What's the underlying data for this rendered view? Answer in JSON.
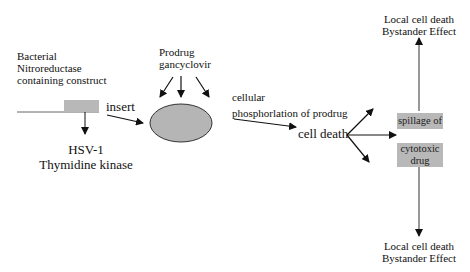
{
  "diagram": {
    "construct": {
      "label_lines": [
        "Bacterial",
        "Nitroreductase",
        "containing construct"
      ],
      "insert_label": "insert",
      "gene_label_lines": [
        "HSV-1",
        "Thymidine kinase"
      ]
    },
    "prodrug": {
      "label_lines": [
        "Prodrug",
        "gancyclovir"
      ]
    },
    "phosphorylation": {
      "label_lines": [
        "cellular",
        "phosphorlation of prodrug"
      ]
    },
    "cell_death": {
      "label": "cell death"
    },
    "spillage": {
      "label": "spillage of"
    },
    "cytotoxic": {
      "label_lines": [
        "cytotoxic",
        "drug"
      ]
    },
    "outcome_top": {
      "label_lines": [
        "Local cell death",
        "Bystander Effect"
      ]
    },
    "outcome_bottom": {
      "label_lines": [
        "Local cell death",
        "Bystander Effect"
      ]
    },
    "colors": {
      "box_fill": "#b8b8b8",
      "cell_fill": "#b5b5b5",
      "stroke": "#111111"
    }
  }
}
